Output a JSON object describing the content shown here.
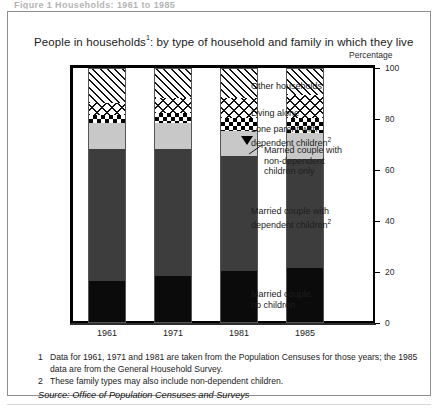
{
  "clipped_top_text": "Figure 1  Households: 1961 to 1985",
  "figure": {
    "title": "People in households",
    "title_superscript": "1",
    "title_rest": ": by type of household and family in which they live",
    "axis_unit_label": "Percentage"
  },
  "notes": [
    {
      "num": "1",
      "text": "Data for 1961, 1971 and 1981 are taken from the Population Censuses for those years; the 1985 data are from the General Household Survey."
    },
    {
      "num": "2",
      "text": "These family types may also include non-dependent children."
    }
  ],
  "source": "Source: Office of Population Censuses and Surveys",
  "legend_labels": {
    "other_households": "Other households",
    "living_alone": "Living alone",
    "lone_parent_l1": "Lone parent with",
    "lone_parent_l2": "dependent children",
    "lone_parent_sup": "2",
    "married_nondep_l1": "Married couple with",
    "married_nondep_l2": "non-dependent",
    "married_nondep_l3": "children only",
    "married_dep_l1": "Married couple with",
    "married_dep_l2": "dependent children",
    "married_dep_sup": "2",
    "married_no_children_l1": "Married couple,",
    "married_no_children_l2": "no children"
  },
  "chart_data": {
    "type": "bar",
    "subtype": "stacked-100",
    "xlabel": "",
    "ylabel": "Percentage",
    "ylim": [
      0,
      100
    ],
    "yticks": [
      0,
      20,
      40,
      60,
      80,
      100
    ],
    "grid": false,
    "legend_position": "inline-annotations",
    "categories": [
      "1961",
      "1971",
      "1981",
      "1985"
    ],
    "series": [
      {
        "name": "Married couple, no children",
        "values": [
          16,
          18,
          20,
          21
        ],
        "color": "#0b0b0b",
        "pattern": "solid-black"
      },
      {
        "name": "Married couple with dependent children",
        "values": [
          52,
          50,
          45,
          43
        ],
        "color": "#3d3d3d",
        "pattern": "solid-dark-grey"
      },
      {
        "name": "Married couple with non-dependent children only",
        "values": [
          10,
          10,
          10,
          10
        ],
        "color": "#c8c8c8",
        "pattern": "solid-light-grey"
      },
      {
        "name": "Lone parent with dependent children",
        "values": [
          3,
          4,
          5,
          6
        ],
        "color": "#000000",
        "pattern": "checkerboard"
      },
      {
        "name": "Living alone",
        "values": [
          5,
          6,
          8,
          9
        ],
        "color": "#111111",
        "pattern": "cross-lattice"
      },
      {
        "name": "Other households",
        "values": [
          14,
          12,
          12,
          11
        ],
        "color": "#111111",
        "pattern": "diagonal-hatch"
      }
    ]
  }
}
